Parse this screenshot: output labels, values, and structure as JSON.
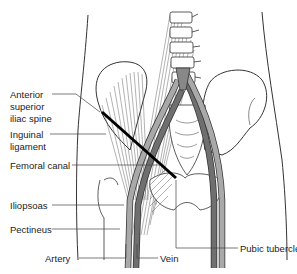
{
  "diagram": {
    "type": "anatomical-illustration",
    "colors": {
      "artery": "#a9a9a9",
      "vein": "#6f6f6f",
      "ligament": "#000000",
      "outline": "#333333",
      "muscle_lines": "#555555"
    },
    "labels": {
      "asis": "Anterior superior iliac spine",
      "asis_line1": "Anterior",
      "asis_line2": "superior",
      "asis_line3": "iliac spine",
      "inguinal_line1": "Inguinal",
      "inguinal_line2": "ligament",
      "femoral_canal": "Femoral canal",
      "iliopsoas": "Iliopsoas",
      "pectineus": "Pectineus",
      "artery": "Artery",
      "vein": "Vein",
      "pubic_tubercle": "Pubic tubercle"
    }
  }
}
